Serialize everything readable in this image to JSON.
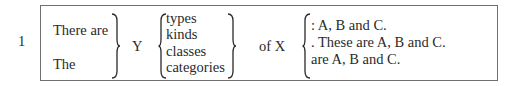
{
  "example_number": "1",
  "left_column": [
    "There are",
    "The"
  ],
  "middle_symbol": "Y",
  "nouns": [
    "types",
    "kinds",
    "classes",
    "categories"
  ],
  "connector": "of X",
  "endings": [
    ": A, B and C.",
    ". These are A, B and C.",
    "are A, B and C."
  ]
}
